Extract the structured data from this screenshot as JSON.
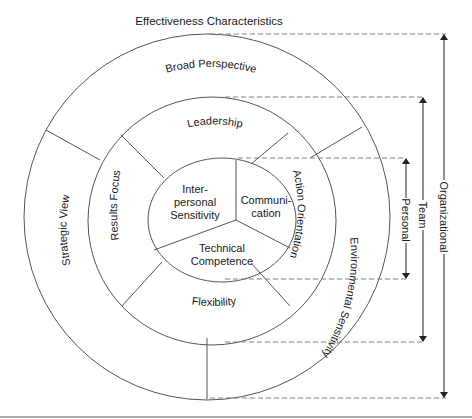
{
  "title": "Effectiveness Characteristics",
  "rings": {
    "outer": {
      "name": "organizational",
      "segments": [
        "Broad Perspective",
        "Strategic View",
        "Environmental Sensitivity"
      ]
    },
    "middle": {
      "name": "team",
      "segments": [
        "Leadership",
        "Results Focus",
        "Action Orientation",
        "Flexibility"
      ]
    },
    "inner": {
      "name": "personal",
      "segments": [
        {
          "lines": [
            "Inter-",
            "personal",
            "Sensitivity"
          ]
        },
        {
          "lines": [
            "Communi-",
            "cation"
          ]
        },
        {
          "lines": [
            "Technical",
            "Competence"
          ]
        }
      ]
    }
  },
  "scale_labels": {
    "personal": "Personal",
    "team": "Team",
    "organizational": "Organizational"
  },
  "labels": {
    "broad_perspective": "Broad Perspective",
    "strategic_view": "Strategic View",
    "environmental_sensitivity": "Environmental Sensitivity",
    "leadership": "Leadership",
    "results_focus": "Results Focus",
    "action_orientation": "Action Orientation",
    "flexibility": "Flexibility",
    "interpersonal_1": "Inter-",
    "interpersonal_2": "personal",
    "interpersonal_3": "Sensitivity",
    "communication_1": "Communi-",
    "communication_2": "cation",
    "technical_1": "Technical",
    "technical_2": "Competence"
  },
  "colors": {
    "line": "#555555",
    "text": "#1a1a1a",
    "background": "#ffffff"
  }
}
